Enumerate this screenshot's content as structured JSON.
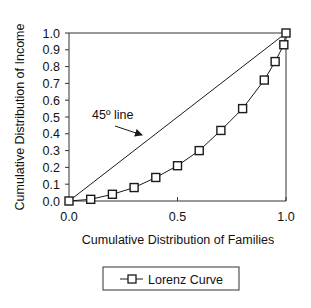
{
  "chart_data": {
    "type": "line",
    "title": "",
    "xlabel": "Cumulative Distribution of Families",
    "ylabel": "Cumulative Distribution of Income",
    "xlim": [
      0,
      1
    ],
    "ylim": [
      0,
      1
    ],
    "x_ticks": [
      "0.0",
      "0.5",
      "1.0"
    ],
    "y_ticks": [
      "0.0",
      "0.1",
      "0.2",
      "0.3",
      "0.4",
      "0.5",
      "0.6",
      "0.7",
      "0.8",
      "0.9",
      "1.0"
    ],
    "grid": false,
    "legend_position": "bottom",
    "series": [
      {
        "name": "Lorenz Curve",
        "marker": "square",
        "x": [
          0.0,
          0.1,
          0.2,
          0.3,
          0.4,
          0.5,
          0.6,
          0.7,
          0.8,
          0.9,
          0.95,
          0.99,
          1.0
        ],
        "y": [
          0.0,
          0.01,
          0.04,
          0.08,
          0.14,
          0.21,
          0.3,
          0.42,
          0.55,
          0.72,
          0.83,
          0.93,
          1.0
        ]
      },
      {
        "name": "45º line",
        "marker": "none",
        "x": [
          0,
          1
        ],
        "y": [
          0,
          1
        ]
      }
    ],
    "annotations": [
      {
        "text": "45º line",
        "arrow_to": [
          0.34,
          0.39
        ]
      }
    ]
  },
  "legend": {
    "label": "Lorenz Curve"
  },
  "colors": {
    "line": "#1a1a1a",
    "axis": "#333333",
    "background": "#ffffff"
  }
}
